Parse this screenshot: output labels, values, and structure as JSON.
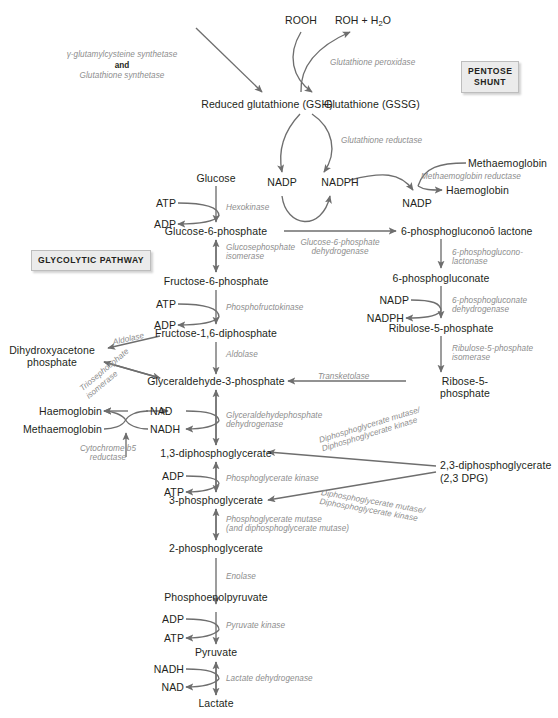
{
  "figure": {
    "boxes": [
      {
        "id": "pentose-shunt",
        "line1": "PENTOSE",
        "line2": "SHUNT"
      },
      {
        "id": "glycolytic-pathway",
        "line1": "GLYCOLYTIC PATHWAY",
        "line2": ""
      }
    ],
    "metabolites": [
      {
        "id": "rooh",
        "text": "ROOH"
      },
      {
        "id": "roh-h2o",
        "text": "ROH + H",
        "sub": "2",
        "post": "O"
      },
      {
        "id": "gsh",
        "text": "Reduced glutathione (GSH)"
      },
      {
        "id": "gssg",
        "text": "Glutathione (GSSG)"
      },
      {
        "id": "nadp-1",
        "text": "NADP"
      },
      {
        "id": "nadph-1",
        "text": "NADPH"
      },
      {
        "id": "methaemoglobin-top",
        "text": "Methaemoglobin"
      },
      {
        "id": "haemoglobin-top",
        "text": "Haemoglobin"
      },
      {
        "id": "nadp-2",
        "text": "NADP"
      },
      {
        "id": "glucose",
        "text": "Glucose"
      },
      {
        "id": "atp-1",
        "text": "ATP"
      },
      {
        "id": "adp-1",
        "text": "ADP"
      },
      {
        "id": "glucose-6-phosphate",
        "text": "Glucose-6-phosphate"
      },
      {
        "id": "6-phosphoglucono-lactone",
        "text": "6-phosphogluconoō lactone"
      },
      {
        "id": "6-phosphogluconate",
        "text": "6-phosphogluconate"
      },
      {
        "id": "nadp-3",
        "text": "NADP"
      },
      {
        "id": "nadph-2",
        "text": "NADPH"
      },
      {
        "id": "ribulose-5-phosphate",
        "text": "Ribulose-5-phosphate"
      },
      {
        "id": "ribose-5-phosphate",
        "text": "Ribose-5-phosphate"
      },
      {
        "id": "fructose-6-phosphate",
        "text": "Fructose-6-phosphate"
      },
      {
        "id": "atp-2",
        "text": "ATP"
      },
      {
        "id": "adp-2",
        "text": "ADP"
      },
      {
        "id": "fructose-16-diphosphate",
        "text": "Fructose-1,6-diphosphate"
      },
      {
        "id": "dihydroxyacetone-phosphate",
        "text": "Dihydroxyacetone phosphate"
      },
      {
        "id": "glyceraldehyde-3-phosphate",
        "text": "Glyceraldehyde-3-phosphate"
      },
      {
        "id": "haemoglobin-mid",
        "text": "Haemoglobin"
      },
      {
        "id": "methaemoglobin-mid",
        "text": "Methaemoglobin"
      },
      {
        "id": "nad-1",
        "text": "NAD"
      },
      {
        "id": "nadh-1",
        "text": "NADH"
      },
      {
        "id": "13-diphosphoglycerate",
        "text": "1,3-diphosphoglycerate"
      },
      {
        "id": "adp-3",
        "text": "ADP"
      },
      {
        "id": "atp-3",
        "text": "ATP"
      },
      {
        "id": "3-phosphoglycerate",
        "text": "3-phosphoglycerate"
      },
      {
        "id": "23-diphosphoglycerate",
        "text": "2,3-diphosphoglycerate"
      },
      {
        "id": "23-dpg",
        "text": "(2,3 DPG)"
      },
      {
        "id": "2-phosphoglycerate",
        "text": "2-phosphoglycerate"
      },
      {
        "id": "phosphoenolpyruvate",
        "text": "Phosphoenolpyruvate"
      },
      {
        "id": "adp-4",
        "text": "ADP"
      },
      {
        "id": "atp-4",
        "text": "ATP"
      },
      {
        "id": "pyruvate",
        "text": "Pyruvate"
      },
      {
        "id": "nadh-2",
        "text": "NADH"
      },
      {
        "id": "nad-2",
        "text": "NAD"
      },
      {
        "id": "lactate",
        "text": "Lactate"
      }
    ],
    "enzymes": [
      {
        "id": "gamma-glutamylcysteine-synthetase",
        "line1": "γ-glutamylcysteine synthetase",
        "line2": "and",
        "line3": "Glutathione synthetase"
      },
      {
        "id": "glutathione-peroxidase",
        "text": "Glutathione peroxidase"
      },
      {
        "id": "glutathione-reductase",
        "text": "Glutathione reductase"
      },
      {
        "id": "methaemoglobin-reductase",
        "text": "Methaemoglobin reductase"
      },
      {
        "id": "hexokinase",
        "text": "Hexokinase"
      },
      {
        "id": "glucosephosphate-isomerase",
        "line1": "Glucosephosphate",
        "line2": "isomerase"
      },
      {
        "id": "glucose-6-phosphate-dehydrogenase",
        "line1": "Glucose-6-phosphate",
        "line2": "dehydrogenase"
      },
      {
        "id": "6-phosphogluconolactonase",
        "line1": "6-phosphoglucono-",
        "line2": "lactonase"
      },
      {
        "id": "6-phosphogluconate-dehydrogenase",
        "line1": "6-phosphogluconate",
        "line2": "dehydrogenase"
      },
      {
        "id": "ribulose-5-phosphate-isomerase",
        "line1": "Ribulose-5-phosphate",
        "line2": "isomerase"
      },
      {
        "id": "phosphofructokinase",
        "text": "Phosphofructokinase"
      },
      {
        "id": "aldolase-1",
        "text": "Aldolase"
      },
      {
        "id": "aldolase-2",
        "text": "Aldolase"
      },
      {
        "id": "triosephosphate-isomerase",
        "line1": "Triosephosphate",
        "line2": "isomerase"
      },
      {
        "id": "transketolase",
        "text": "Transketolase"
      },
      {
        "id": "glyceraldehydephosphate-dehydrogenase",
        "line1": "Glyceraldehydephosphate",
        "line2": "dehydrogenase"
      },
      {
        "id": "cytochrome-b5-reductase",
        "line1": "Cytochrome b5",
        "line2": "reductase"
      },
      {
        "id": "diphosphoglycerate-mutase-kinase-1",
        "line1": "Diphosphoglycerate mutase/",
        "line2": "Diphosphoglycerate kinase"
      },
      {
        "id": "diphosphoglycerate-mutase-kinase-2",
        "line1": "Diphosphoglycerate mutase/",
        "line2": "Diphosphoglycerate kinase"
      },
      {
        "id": "phosphoglycerate-kinase",
        "text": "Phosphoglycerate kinase"
      },
      {
        "id": "phosphoglycerate-mutase",
        "line1": "Phosphoglycerate mutase",
        "line2": "(and diphosphoglycerate mutase)"
      },
      {
        "id": "enolase",
        "text": "Enolase"
      },
      {
        "id": "pyruvate-kinase",
        "text": "Pyruvate kinase"
      },
      {
        "id": "lactate-dehydrogenase",
        "text": "Lactate dehydrogenase"
      }
    ],
    "colors": {
      "metabolite_text": "#231f20",
      "enzyme_text": "#8d8d8d",
      "arrow": "#6e6e6e",
      "box_fill": "#ebebeb",
      "box_border": "#bdbdbd"
    },
    "caption": ""
  }
}
